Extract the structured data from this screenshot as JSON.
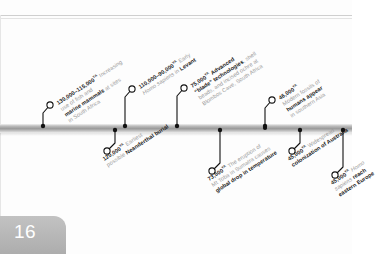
{
  "page": {
    "number": "16"
  },
  "timeline": {
    "axis_label": "timeline-bar",
    "events": [
      {
        "id": "fish-marine-mammals",
        "side": "above",
        "date": "130,000–115,000",
        "unit": "YA",
        "lines": [
          {
            "parts": [
              {
                "t": "130,000–115,000",
                "s": "b"
              },
              {
                "t": "YA",
                "s": "ya"
              },
              {
                "t": " Increasing",
                "s": "g"
              }
            ]
          },
          {
            "parts": [
              {
                "t": "use of fish and",
                "s": "g"
              }
            ]
          },
          {
            "parts": [
              {
                "t": "marine mammals",
                "s": "b"
              },
              {
                "t": " at sites",
                "s": "g"
              }
            ]
          },
          {
            "parts": [
              {
                "t": "in South Africa",
                "s": "g"
              }
            ]
          }
        ],
        "dot_x": 43,
        "circle_x": 50,
        "circle_y": 105,
        "label_x": 55,
        "label_y": 100
      },
      {
        "id": "neanderthal-burial",
        "side": "below",
        "date": "120,000",
        "unit": "YA",
        "lines": [
          {
            "parts": [
              {
                "t": "120,000",
                "s": "b"
              },
              {
                "t": "YA",
                "s": "ya"
              },
              {
                "t": " Earliest",
                "s": "g"
              }
            ]
          },
          {
            "parts": [
              {
                "t": "possible ",
                "s": "g"
              },
              {
                "t": "Neanderthal burial",
                "s": "b"
              }
            ]
          }
        ],
        "dot_x": 115,
        "circle_x": 107,
        "circle_y": 151,
        "label_x": 101,
        "label_y": 156
      },
      {
        "id": "homo-sapiens-levant",
        "side": "above",
        "date": "110,000–90,000",
        "unit": "YA",
        "lines": [
          {
            "parts": [
              {
                "t": "110,000–90,000",
                "s": "b"
              },
              {
                "t": "YA",
                "s": "ya"
              },
              {
                "t": " Early",
                "s": "g"
              }
            ]
          },
          {
            "parts": [
              {
                "t": "Homo sapiens",
                "s": "i"
              },
              {
                "t": " in ",
                "s": "g"
              },
              {
                "t": "Levant",
                "s": "b"
              }
            ]
          }
        ],
        "dot_x": 125,
        "circle_x": 132,
        "circle_y": 89,
        "label_x": 137,
        "label_y": 84
      },
      {
        "id": "blade-technologies-blombos",
        "side": "above",
        "date": "75,000",
        "unit": "YA",
        "lines": [
          {
            "parts": [
              {
                "t": "75,000",
                "s": "b"
              },
              {
                "t": "YA",
                "s": "ya"
              },
              {
                "t": " Advanced",
                "s": "b"
              }
            ]
          },
          {
            "parts": [
              {
                "t": "“blade” technologies",
                "s": "b"
              },
              {
                "t": ", shell",
                "s": "g"
              }
            ]
          },
          {
            "parts": [
              {
                "t": "beads, and incised ochre at",
                "s": "g"
              }
            ]
          },
          {
            "parts": [
              {
                "t": "Blombos Cave, South Africa",
                "s": "g"
              }
            ]
          }
        ],
        "dot_x": 177,
        "circle_x": 184,
        "circle_y": 88,
        "label_x": 189,
        "label_y": 83
      },
      {
        "id": "toba-eruption",
        "side": "below",
        "date": "73,500",
        "unit": "YA",
        "lines": [
          {
            "parts": [
              {
                "t": "73,500",
                "s": "b"
              },
              {
                "t": "YA",
                "s": "ya"
              },
              {
                "t": " The eruption of",
                "s": "g"
              }
            ]
          },
          {
            "parts": [
              {
                "t": "Mt Toba in Sumatra causes",
                "s": "g"
              }
            ]
          },
          {
            "parts": [
              {
                "t": "global drop in temperature",
                "s": "b"
              }
            ]
          }
        ],
        "dot_x": 220,
        "circle_x": 212,
        "circle_y": 171,
        "label_x": 206,
        "label_y": 176
      },
      {
        "id": "colonization-australia",
        "side": "below",
        "date": "45,000",
        "unit": "YA",
        "lines": [
          {
            "parts": [
              {
                "t": "45,000",
                "s": "b"
              },
              {
                "t": "YA",
                "s": "ya"
              },
              {
                "t": " Widespread",
                "s": "g"
              }
            ]
          },
          {
            "parts": [
              {
                "t": "colonization of Australia",
                "s": "b"
              }
            ]
          }
        ],
        "dot_x": 300,
        "circle_x": 292,
        "circle_y": 151,
        "label_x": 286,
        "label_y": 156
      },
      {
        "id": "modern-fossils-southern-asia",
        "side": "above",
        "date": "46,000",
        "unit": "YA",
        "lines": [
          {
            "parts": [
              {
                "t": "46,000",
                "s": "b"
              },
              {
                "t": "YA",
                "s": "ya"
              }
            ]
          },
          {
            "parts": [
              {
                "t": "Modern fossils of",
                "s": "g"
              }
            ]
          },
          {
            "parts": [
              {
                "t": "humans appear",
                "s": "b"
              }
            ]
          },
          {
            "parts": [
              {
                "t": "in southern Asia",
                "s": "g"
              }
            ]
          }
        ],
        "dot_x": 265,
        "circle_x": 272,
        "circle_y": 100,
        "label_x": 277,
        "label_y": 95
      },
      {
        "id": "homo-sapiens-eastern-europe",
        "side": "below",
        "date": "45,000",
        "unit": "YA",
        "lines": [
          {
            "parts": [
              {
                "t": "45,000",
                "s": "b"
              },
              {
                "t": "YA",
                "s": "ya"
              },
              {
                "t": " Homo",
                "s": "i"
              }
            ]
          },
          {
            "parts": [
              {
                "t": "sapiens",
                "s": "i"
              },
              {
                "t": " reach",
                "s": "b"
              }
            ]
          },
          {
            "parts": [
              {
                "t": "eastern Europe",
                "s": "b"
              }
            ]
          }
        ],
        "dot_x": 343,
        "circle_x": 335,
        "circle_y": 175,
        "label_x": 329,
        "label_y": 180
      }
    ],
    "extra_dots": [
      {
        "x": 265,
        "y": 128
      }
    ]
  },
  "colors": {
    "bar": "#9a9a9a",
    "dot": "#111111",
    "text_bold": "#1b1b1b",
    "text_muted": "#9a9a9a",
    "page_tab": "#b5b5b5"
  }
}
